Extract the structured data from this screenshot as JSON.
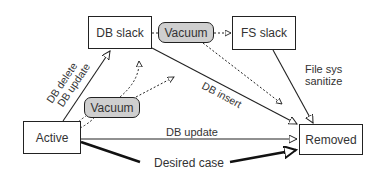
{
  "diagram": {
    "nodes": {
      "db_slack": "DB slack",
      "fs_slack": "FS slack",
      "active": "Active",
      "removed": "Removed",
      "vacuum_top": "Vacuum",
      "vacuum_mid": "Vacuum"
    },
    "edges": {
      "active_to_dbslack": [
        "DB delete",
        "DB update"
      ],
      "dbslack_to_removed": "DB insert",
      "active_to_removed": "DB update",
      "fsslack_to_removed": [
        "File sys",
        "sanitize"
      ],
      "desired": "Desired case"
    }
  }
}
